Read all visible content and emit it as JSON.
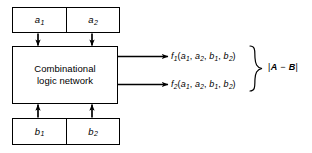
{
  "figure": {
    "type": "block-diagram",
    "background_color": "#ffffff",
    "line_color": "#000000"
  },
  "input_register_a": {
    "name": "a-register",
    "cells": [
      {
        "var": "a",
        "sub": "1"
      },
      {
        "var": "a",
        "sub": "2"
      }
    ]
  },
  "input_register_b": {
    "name": "b-register",
    "cells": [
      {
        "var": "b",
        "sub": "1"
      },
      {
        "var": "b",
        "sub": "2"
      }
    ]
  },
  "logic_block": {
    "line1": "Combinational",
    "line2": "logic network"
  },
  "outputs": [
    {
      "fn": "f",
      "fn_sub": "1",
      "open": "(",
      "args": [
        {
          "var": "a",
          "sub": "1"
        },
        {
          "var": "a",
          "sub": "2"
        },
        {
          "var": "b",
          "sub": "1"
        },
        {
          "var": "b",
          "sub": "2"
        }
      ],
      "close": ")",
      "separator": ","
    },
    {
      "fn": "f",
      "fn_sub": "2",
      "open": "(",
      "args": [
        {
          "var": "a",
          "sub": "1"
        },
        {
          "var": "a",
          "sub": "2"
        },
        {
          "var": "b",
          "sub": "1"
        },
        {
          "var": "b",
          "sub": "2"
        }
      ],
      "close": ")",
      "separator": ","
    }
  ],
  "result_label": {
    "left_bar": "|",
    "minuend": "A",
    "operator": "−",
    "subtrahend": "B",
    "right_bar": "|"
  },
  "connectors": {
    "a1_to_logic": "arrow-down",
    "a2_to_logic": "arrow-down",
    "b1_to_logic": "arrow-up",
    "b2_to_logic": "arrow-up",
    "logic_to_f1": "arrow-right",
    "logic_to_f2": "arrow-right",
    "grouping": "right-curly-brace"
  }
}
